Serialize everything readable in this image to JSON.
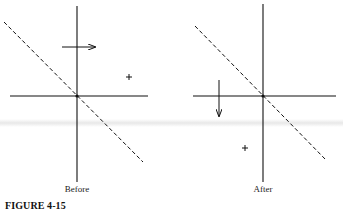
{
  "figure": {
    "caption": "FIGURE 4-15",
    "panels": [
      {
        "id": "before",
        "label": "Before",
        "arrow_direction": "right",
        "marker": "+",
        "marker_position": "upper-right quadrant"
      },
      {
        "id": "after",
        "label": "After",
        "arrow_direction": "down",
        "marker": "+",
        "marker_position": "lower-left quadrant"
      }
    ],
    "colors": {
      "line": "#111111",
      "background": "#ffffff"
    }
  }
}
